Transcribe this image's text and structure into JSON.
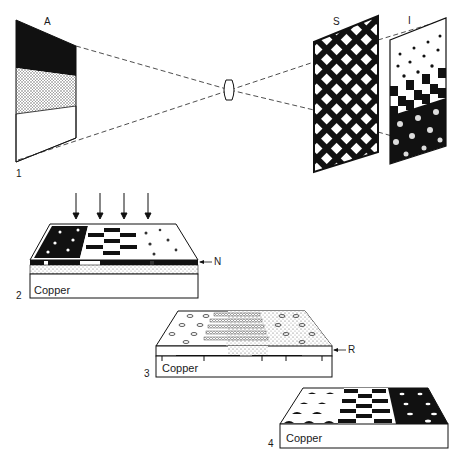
{
  "figure": {
    "panel_1": {
      "number": "1",
      "original_label": "A",
      "lens_label": "",
      "screen_label": "S",
      "image_label": "I"
    },
    "panel_2": {
      "number": "2",
      "layer_label": "N",
      "substrate": "Copper",
      "exposure_arrows": 4
    },
    "panel_3": {
      "number": "3",
      "layer_label": "R",
      "substrate": "Copper"
    },
    "panel_4": {
      "number": "4",
      "substrate": "Copper"
    }
  },
  "colors": {
    "ink": "#111111",
    "paper": "#ffffff",
    "stipple": "#9a9a9a"
  }
}
